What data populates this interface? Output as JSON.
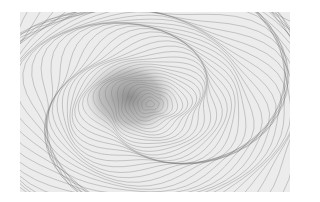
{
  "image": {
    "subject": "abstract concentric contour line drawing",
    "colors": {
      "background": "#ffffff",
      "paper": "#ececec",
      "line": "#6a6a6a",
      "center_shade": "#7a7a7a"
    },
    "center": {
      "x": 130,
      "y": 92
    },
    "ring_count": 60
  }
}
